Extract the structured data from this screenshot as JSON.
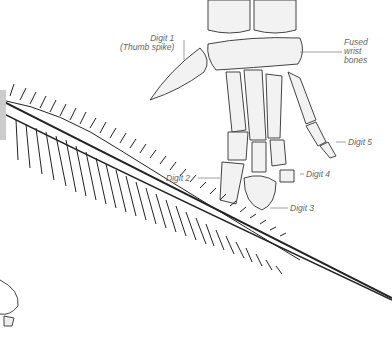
{
  "diagram": {
    "labels": {
      "digit1": "Digit 1",
      "digit1_note": "(Thumb spike)",
      "fused_1": "Fused",
      "fused_2": "wrist",
      "fused_3": "bones",
      "digit2": "Digit 2",
      "digit3": "Digit 3",
      "digit4": "Digit 4",
      "digit5": "Digit 5"
    },
    "colors": {
      "ink": "#333333",
      "label": "#666666",
      "bone_fill": "#f1f1f1"
    }
  }
}
